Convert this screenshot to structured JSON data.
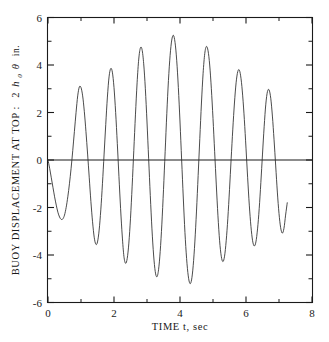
{
  "chart_data": {
    "type": "line",
    "title": "",
    "xlabel": "TIME t, sec",
    "ylabel": "BUOY DISPLACEMENT AT TOP :  2 h₀ θ in.",
    "ylabel_parts": {
      "text_main": "BUOY DISPLACEMENT AT TOP :",
      "coefficient": "2",
      "symbol_h": "h",
      "symbol_h_sub": "0",
      "symbol_theta": "θ",
      "units": "in."
    },
    "xlim": [
      0,
      8
    ],
    "ylim": [
      -6,
      6
    ],
    "xticks": [
      0,
      2,
      4,
      6,
      8
    ],
    "xticklabels": [
      "0",
      "2",
      "4",
      "6",
      "8"
    ],
    "xticks_minor": [
      1,
      3,
      5,
      7
    ],
    "yticks": [
      -6,
      -4,
      -2,
      0,
      2,
      4,
      6
    ],
    "yticklabels": [
      "-6",
      "-4",
      "-2",
      "0",
      "2",
      "4",
      "6"
    ],
    "yticks_minor": [
      -5,
      -3,
      -1,
      1,
      3,
      5
    ],
    "grid": false,
    "legend": null,
    "zero_reference_line": 0,
    "series": [
      {
        "name": "buoy displacement at top",
        "color": "#2a2a2a",
        "x": [
          0.0,
          0.05,
          0.1,
          0.15,
          0.2,
          0.25,
          0.3,
          0.35,
          0.4,
          0.45,
          0.5,
          0.55,
          0.6,
          0.65,
          0.7,
          0.75,
          0.8,
          0.85,
          0.9,
          0.95,
          1.0,
          1.05,
          1.1,
          1.15,
          1.2,
          1.25,
          1.3,
          1.35,
          1.4,
          1.45,
          1.5,
          1.55,
          1.6,
          1.65,
          1.7,
          1.75,
          1.8,
          1.85,
          1.9,
          1.95,
          2.0,
          2.05,
          2.1,
          2.15,
          2.2,
          2.25,
          2.3,
          2.35,
          2.4,
          2.45,
          2.5,
          2.55,
          2.6,
          2.65,
          2.7,
          2.75,
          2.8,
          2.85,
          2.9,
          2.95,
          3.0,
          3.05,
          3.1,
          3.15,
          3.2,
          3.25,
          3.3,
          3.35,
          3.4,
          3.45,
          3.5,
          3.55,
          3.6,
          3.65,
          3.7,
          3.75,
          3.8,
          3.85,
          3.9,
          3.95,
          4.0,
          4.05,
          4.1,
          4.15,
          4.2,
          4.25,
          4.3,
          4.35,
          4.4,
          4.45,
          4.5,
          4.55,
          4.6,
          4.65,
          4.7,
          4.75,
          4.8,
          4.85,
          4.9,
          4.95,
          5.0,
          5.05,
          5.1,
          5.15,
          5.2,
          5.25,
          5.3,
          5.35,
          5.4,
          5.45,
          5.5,
          5.55,
          5.6,
          5.65,
          5.7,
          5.75,
          5.8,
          5.85,
          5.9,
          5.95,
          6.0,
          6.05,
          6.1,
          6.15,
          6.2,
          6.25,
          6.3,
          6.35,
          6.4,
          6.45,
          6.5,
          6.55,
          6.6,
          6.65,
          6.7,
          6.75,
          6.8,
          6.85,
          6.9,
          6.95,
          7.0,
          7.05,
          7.1,
          7.15,
          7.2,
          7.25
        ],
        "y": [
          0.0,
          -0.35,
          -0.75,
          -1.15,
          -1.55,
          -1.9,
          -2.2,
          -2.4,
          -2.5,
          -2.48,
          -2.32,
          -2.0,
          -1.55,
          -1.0,
          -0.35,
          0.4,
          1.2,
          2.0,
          2.7,
          3.08,
          3.05,
          2.7,
          2.05,
          1.2,
          0.25,
          -0.75,
          -1.75,
          -2.6,
          -3.25,
          -3.55,
          -3.45,
          -2.95,
          -2.1,
          -1.0,
          0.25,
          1.5,
          2.65,
          3.5,
          3.85,
          3.7,
          3.05,
          2.0,
          0.7,
          -0.7,
          -2.05,
          -3.2,
          -4.05,
          -4.35,
          -4.15,
          -3.5,
          -2.45,
          -1.1,
          0.4,
          1.9,
          3.25,
          4.25,
          4.72,
          4.65,
          4.05,
          3.0,
          1.6,
          0.05,
          -1.5,
          -2.9,
          -4.0,
          -4.7,
          -4.92,
          -4.62,
          -3.85,
          -2.7,
          -1.25,
          0.35,
          1.95,
          3.35,
          4.4,
          5.05,
          5.25,
          4.95,
          4.2,
          3.05,
          1.6,
          0.0,
          -1.6,
          -3.05,
          -4.15,
          -4.88,
          -5.2,
          -5.05,
          -4.45,
          -3.45,
          -2.15,
          -0.65,
          0.9,
          2.4,
          3.65,
          4.48,
          4.78,
          4.6,
          4.0,
          3.0,
          1.75,
          0.35,
          -1.05,
          -2.35,
          -3.4,
          -4.05,
          -4.28,
          -4.05,
          -3.4,
          -2.45,
          -1.25,
          0.05,
          1.3,
          2.4,
          3.25,
          3.72,
          3.78,
          3.42,
          2.7,
          1.7,
          0.5,
          -0.75,
          -1.9,
          -2.8,
          -3.4,
          -3.62,
          -3.45,
          -2.9,
          -2.05,
          -0.95,
          0.25,
          1.4,
          2.35,
          2.88,
          2.95,
          2.6,
          1.85,
          0.85,
          -0.25,
          -1.35,
          -2.25,
          -2.85,
          -3.08,
          -2.88,
          -2.32,
          -1.8
        ]
      }
    ],
    "observed_peaks": [
      {
        "t": 0.45,
        "value": -2.5
      },
      {
        "t": 0.9,
        "value": 3.1
      },
      {
        "t": 1.25,
        "value": -3.55
      },
      {
        "t": 1.6,
        "value": 3.85
      },
      {
        "t": 1.9,
        "value": -4.35
      },
      {
        "t": 2.25,
        "value": 4.72
      },
      {
        "t": 2.4,
        "value": -5.2
      },
      {
        "t": 2.8,
        "value": 5.25
      },
      {
        "t": 2.95,
        "value": -5.2
      },
      {
        "t": 3.3,
        "value": 4.7
      },
      {
        "t": 3.6,
        "value": -4.0
      },
      {
        "t": 4.05,
        "value": 2.9
      },
      {
        "t": 4.65,
        "value": -3.1
      },
      {
        "t": 5.1,
        "value": 3.8
      },
      {
        "t": 5.4,
        "value": -4.5
      },
      {
        "t": 5.8,
        "value": 4.85
      },
      {
        "t": 5.95,
        "value": -5.15
      },
      {
        "t": 6.3,
        "value": 4.85
      },
      {
        "t": 6.55,
        "value": -4.65
      },
      {
        "t": 6.95,
        "value": 3.75
      },
      {
        "t": 7.25,
        "value": -1.8
      }
    ]
  },
  "figure": {
    "background_color": "#ffffff",
    "axis_color": "#1a1a1a",
    "curve_color": "#2a2a2a"
  }
}
